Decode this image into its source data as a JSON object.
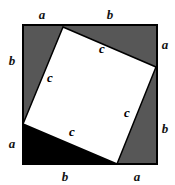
{
  "figure": {
    "canvas": {
      "width": 175,
      "height": 185
    },
    "background_color": "#ffffff",
    "outer_square": {
      "name": "outer-square",
      "fill_color": "#575757",
      "stroke_color": "#000000",
      "stroke_width": 2,
      "left": 23,
      "top": 25,
      "right": 157,
      "bottom": 164
    },
    "inner_square": {
      "name": "inner-tilted-square",
      "fill_color": "#ffffff",
      "stroke_color": "#000000",
      "stroke_width": 1.5,
      "points": "63,27 156,67 117,164 23,124"
    },
    "highlight_triangle": {
      "name": "black-right-triangle",
      "fill_color": "#000000",
      "points": "23,124 117,164 23,164"
    },
    "labels": {
      "outer": [
        {
          "text": "a",
          "x": 42,
          "y": 14,
          "name": "label-a-top-left"
        },
        {
          "text": "b",
          "x": 110,
          "y": 14,
          "name": "label-b-top-right"
        },
        {
          "text": "a",
          "x": 165,
          "y": 44,
          "name": "label-a-right-top"
        },
        {
          "text": "b",
          "x": 165,
          "y": 128,
          "name": "label-b-right-bottom"
        },
        {
          "text": "a",
          "x": 137,
          "y": 176,
          "name": "label-a-bottom-right"
        },
        {
          "text": "b",
          "x": 65,
          "y": 176,
          "name": "label-b-bottom-left"
        },
        {
          "text": "a",
          "x": 12,
          "y": 143,
          "name": "label-a-left-bottom"
        },
        {
          "text": "b",
          "x": 12,
          "y": 60,
          "name": "label-b-left-top"
        }
      ],
      "inner": [
        {
          "text": "c",
          "x": 102,
          "y": 48,
          "name": "label-c-top"
        },
        {
          "text": "c",
          "x": 50,
          "y": 77,
          "name": "label-c-left"
        },
        {
          "text": "c",
          "x": 127,
          "y": 112,
          "name": "label-c-right"
        },
        {
          "text": "c",
          "x": 72,
          "y": 131,
          "name": "label-c-bottom"
        }
      ]
    }
  }
}
